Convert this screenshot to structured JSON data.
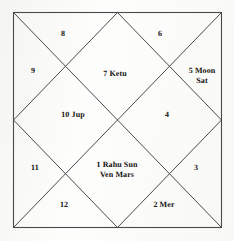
{
  "chart": {
    "style": "north-indian-kundali",
    "frame": {
      "left": 13,
      "top": 12,
      "right": 222,
      "bottom": 228,
      "line_color": "#4a4a4a",
      "line_width": 1
    },
    "text_color": "#14120f",
    "background_color": "#fdfdfc",
    "houses": [
      {
        "number": "1",
        "label": "1 Rahu Sun\nVen Mars",
        "planets": [
          "Rahu",
          "Sun",
          "Ven",
          "Mars"
        ],
        "position": "center-bottom"
      },
      {
        "number": "2",
        "label": "2 Mer",
        "planets": [
          "Mer"
        ],
        "position": "bottom-right-triangle"
      },
      {
        "number": "3",
        "label": "3",
        "planets": [],
        "position": "right-bottom-triangle"
      },
      {
        "number": "4",
        "label": "4",
        "planets": [],
        "position": "center-right"
      },
      {
        "number": "5",
        "label": "5 Moon\nSat",
        "planets": [
          "Moon",
          "Sat"
        ],
        "position": "right-top-triangle"
      },
      {
        "number": "6",
        "label": "6",
        "planets": [],
        "position": "top-right-triangle"
      },
      {
        "number": "7",
        "label": "7 Ketu",
        "planets": [
          "Ketu"
        ],
        "position": "center-top"
      },
      {
        "number": "8",
        "label": "8",
        "planets": [],
        "position": "top-left-triangle"
      },
      {
        "number": "9",
        "label": "9",
        "planets": [],
        "position": "left-top-triangle"
      },
      {
        "number": "10",
        "label": "10 Jup",
        "planets": [
          "Jup"
        ],
        "position": "center-left"
      },
      {
        "number": "11",
        "label": "11",
        "planets": [],
        "position": "left-bottom-triangle"
      },
      {
        "number": "12",
        "label": "12",
        "planets": [],
        "position": "bottom-left-triangle"
      }
    ]
  }
}
